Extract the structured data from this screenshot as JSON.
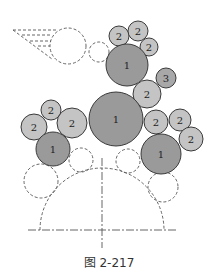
{
  "figure": {
    "caption": "图 2-217",
    "colors": {
      "gear1_fill": "#9a9a9a",
      "gear2_fill": "#c4c4c4",
      "gear3_fill": "#a8a8a8",
      "stroke": "#3a3a3a",
      "dashed": "#555555"
    },
    "gears": [
      {
        "label": "2",
        "cx": 119,
        "cy": 36,
        "r": 10,
        "type": "2"
      },
      {
        "label": "2",
        "cx": 138,
        "cy": 31,
        "r": 10,
        "type": "2"
      },
      {
        "label": "2",
        "cx": 149,
        "cy": 47,
        "r": 9,
        "type": "2"
      },
      {
        "label": "1",
        "cx": 127,
        "cy": 65,
        "r": 21,
        "type": "1"
      },
      {
        "label": "3",
        "cx": 166,
        "cy": 78,
        "r": 10,
        "type": "3"
      },
      {
        "label": "2",
        "cx": 147,
        "cy": 94,
        "r": 14,
        "type": "2"
      },
      {
        "label": "1",
        "cx": 116,
        "cy": 119,
        "r": 27,
        "type": "1"
      },
      {
        "label": "2",
        "cx": 51,
        "cy": 110,
        "r": 10,
        "type": "2"
      },
      {
        "label": "2",
        "cx": 34,
        "cy": 127,
        "r": 13,
        "type": "2"
      },
      {
        "label": "2",
        "cx": 72,
        "cy": 123,
        "r": 15,
        "type": "2"
      },
      {
        "label": "1",
        "cx": 53,
        "cy": 149,
        "r": 17,
        "type": "1"
      },
      {
        "label": "2",
        "cx": 156,
        "cy": 122,
        "r": 12,
        "type": "2"
      },
      {
        "label": "2",
        "cx": 180,
        "cy": 120,
        "r": 11,
        "type": "2"
      },
      {
        "label": "2",
        "cx": 191,
        "cy": 139,
        "r": 12,
        "type": "2"
      },
      {
        "label": "1",
        "cx": 161,
        "cy": 154,
        "r": 20,
        "type": "1"
      }
    ],
    "dashed_circles": [
      {
        "cx": 68,
        "cy": 46,
        "r": 18
      },
      {
        "cx": 99,
        "cy": 52,
        "r": 10
      },
      {
        "cx": 81,
        "cy": 160,
        "r": 12
      },
      {
        "cx": 128,
        "cy": 161,
        "r": 12
      },
      {
        "cx": 41,
        "cy": 181,
        "r": 17
      },
      {
        "cx": 163,
        "cy": 187,
        "r": 15
      }
    ],
    "dome": {
      "cx": 102,
      "cy": 230,
      "r": 62
    }
  }
}
